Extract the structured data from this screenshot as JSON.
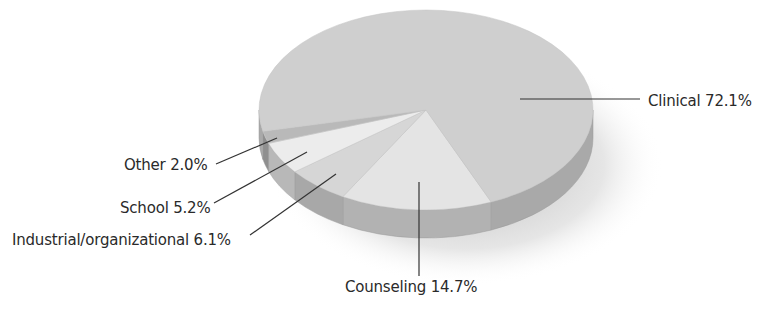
{
  "chart_data": {
    "type": "pie",
    "style": "3d",
    "title": "",
    "slices": [
      {
        "label": "Clinical",
        "value": 72.1,
        "display": "Clinical 72.1%",
        "color": "#cfcfcf",
        "side": "#a9a9a9"
      },
      {
        "label": "Counseling",
        "value": 14.7,
        "display": "Counseling 14.7%",
        "color": "#e4e4e4",
        "side": "#b2b2b2"
      },
      {
        "label": "Industrial/organizational",
        "value": 6.1,
        "display": "Industrial/organizational 6.1%",
        "color": "#d6d6d6",
        "side": "#a8a8a8"
      },
      {
        "label": "School",
        "value": 5.2,
        "display": "School 5.2%",
        "color": "#ececec",
        "side": "#b8b8b8"
      },
      {
        "label": "Other",
        "value": 2.0,
        "display": "Other 2.0%",
        "color": "#b9b9b9",
        "side": "#8f8f8f"
      }
    ],
    "legend": "none (callout labels)"
  },
  "labels": {
    "clinical": "Clinical 72.1%",
    "counseling": "Counseling 14.7%",
    "industrial": "Industrial/organizational 6.1%",
    "school": "School 5.2%",
    "other": "Other 2.0%"
  }
}
